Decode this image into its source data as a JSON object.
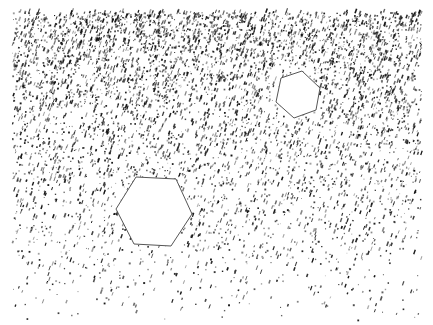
{
  "canvas": {
    "width": 433,
    "height": 325,
    "background": "#ffffff"
  },
  "noise": {
    "region": {
      "x0": 12,
      "y0": 12,
      "x1": 421,
      "y1": 320
    },
    "color": "#111111",
    "density_top": 0.55,
    "density_bottom": 0.02,
    "falloff_power": 1.6,
    "speck_count": 26000,
    "seed": 7,
    "halo": {
      "cx": 298,
      "cy": 95,
      "radius": 42,
      "strength": 0.8
    }
  },
  "shapes": [
    {
      "name": "small-hexagon",
      "points": [
        [
          281,
          78
        ],
        [
          302,
          71
        ],
        [
          320,
          88
        ],
        [
          316,
          110
        ],
        [
          294,
          118
        ],
        [
          276,
          102
        ]
      ],
      "stroke": "#555555",
      "fill": "#ffffff",
      "stroke_width": 1
    },
    {
      "name": "large-hexagon",
      "points": [
        [
          136,
          177
        ],
        [
          176,
          179
        ],
        [
          192,
          214
        ],
        [
          171,
          246
        ],
        [
          134,
          244
        ],
        [
          116,
          209
        ]
      ],
      "stroke": "#555555",
      "fill": "#ffffff",
      "stroke_width": 1
    }
  ]
}
